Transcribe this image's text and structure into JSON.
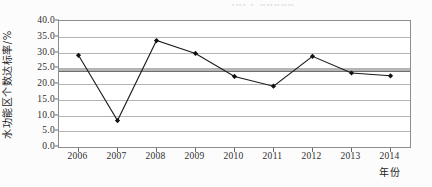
{
  "scan_artifact_text": "。。。。 。 。。。。。。。。。。",
  "chart_data": {
    "type": "line",
    "title": "",
    "xlabel": "年份",
    "ylabel": "水功能区个数达标率/%",
    "categories": [
      "2006",
      "2007",
      "2008",
      "2009",
      "2010",
      "2011",
      "2012",
      "2013",
      "2014"
    ],
    "values": [
      29.1,
      8.4,
      33.8,
      29.7,
      22.4,
      19.3,
      28.8,
      23.5,
      22.6
    ],
    "series": [
      {
        "name": "水功能区个数达标率",
        "values": [
          29.1,
          8.4,
          33.8,
          29.7,
          22.4,
          19.3,
          28.8,
          23.5,
          22.6
        ]
      }
    ],
    "ylim": [
      0.0,
      40.0
    ],
    "ytick_labels": [
      "0.0",
      "5.0",
      "10.0",
      "15.0",
      "20.0",
      "25.0",
      "30.0",
      "35.0",
      "40.0"
    ],
    "ytick_values": [
      0.0,
      5.0,
      10.0,
      15.0,
      20.0,
      25.0,
      30.0,
      35.0,
      40.0
    ],
    "xtick_labels": [
      "2006",
      "2007",
      "2008",
      "2009",
      "2010",
      "2011",
      "2012",
      "2013",
      "2014"
    ],
    "grid": true,
    "legend": "none",
    "marker": "diamond",
    "line_color": "#1a1a1a",
    "marker_color": "#111111",
    "grid_color": "#b4b4b4",
    "reference_lines": [
      {
        "name": "average-reference-line",
        "value": 24.3,
        "color": "#a8a8a8",
        "style": "thick-band"
      }
    ],
    "annotations": []
  }
}
